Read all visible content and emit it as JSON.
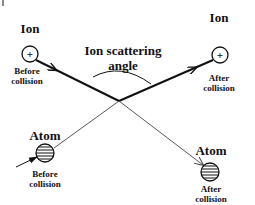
{
  "diagram": {
    "title_text": "Ion scattering angle",
    "angle_label_line1": "Ion scattering",
    "angle_label_line2": "angle",
    "ion_before": {
      "label": "Ion",
      "symbol": "+",
      "caption_line1": "Before",
      "caption_line2": "collision"
    },
    "ion_after": {
      "label": "Ion",
      "symbol": "+",
      "caption_line1": "After",
      "caption_line2": "collision"
    },
    "atom_before": {
      "label": "Atom",
      "caption_line1": "Before",
      "caption_line2": "collision"
    },
    "atom_after": {
      "label": "Atom",
      "caption_line1": "After",
      "caption_line2": "collision"
    },
    "colors": {
      "stroke": "#111111",
      "thin_stroke": "#444444",
      "background": "#ffffff"
    }
  }
}
